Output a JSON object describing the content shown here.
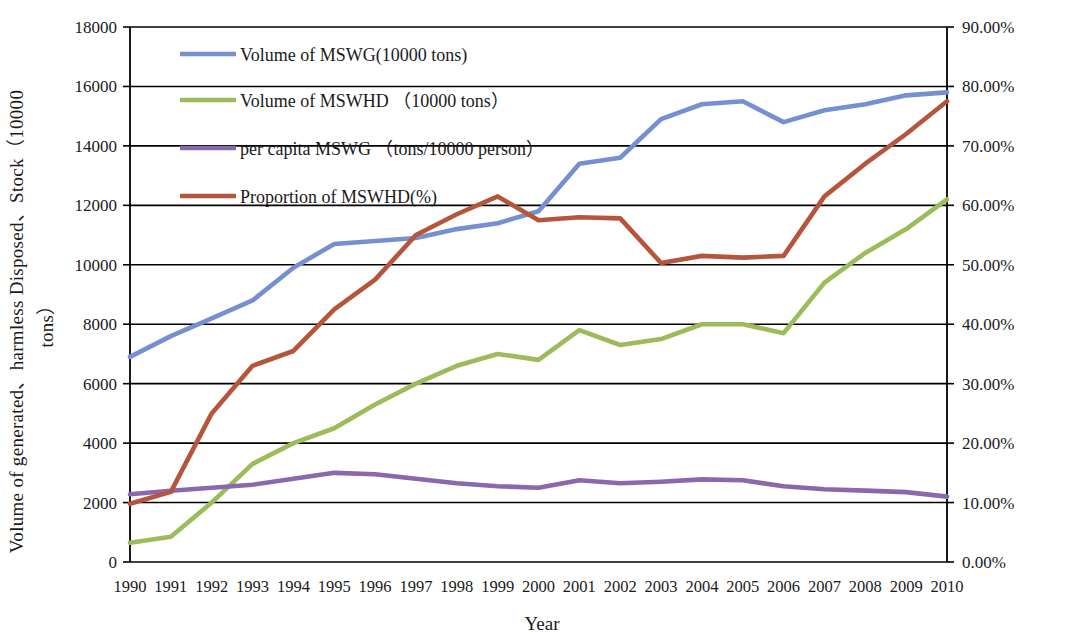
{
  "chart_data": {
    "type": "line",
    "title": "",
    "xlabel": "Year",
    "ylabel": "Volume of generated、harmless Disposed、Stock（10000 tons）",
    "ylabel_line1": "Volume of generated、harmless Disposed、Stock（10000",
    "ylabel_line2": "tons）",
    "y2label": "Proportion of MSWHD(%)",
    "grid": true,
    "legend_position": "top-left inside plot",
    "categories": [
      "1990",
      "1991",
      "1992",
      "1993",
      "1994",
      "1995",
      "1996",
      "1997",
      "1998",
      "1999",
      "2000",
      "2001",
      "2002",
      "2003",
      "2004",
      "2005",
      "2006",
      "2007",
      "2008",
      "2009",
      "2010"
    ],
    "ylim": [
      0,
      18000
    ],
    "yticks": [
      "0",
      "2000",
      "4000",
      "6000",
      "8000",
      "10000",
      "12000",
      "14000",
      "16000",
      "18000"
    ],
    "y2lim": [
      0,
      90
    ],
    "y2ticks": [
      "0.00%",
      "10.00%",
      "20.00%",
      "30.00%",
      "40.00%",
      "50.00%",
      "60.00%",
      "70.00%",
      "80.00%",
      "90.00%"
    ],
    "series": [
      {
        "name": "Volume of MSWG(10000 tons)",
        "color": "#7490d0",
        "axis": "left",
        "values": [
          6900,
          7600,
          8200,
          8800,
          9900,
          10700,
          10800,
          10900,
          11200,
          11400,
          11800,
          13400,
          13600,
          14900,
          15400,
          15500,
          14800,
          15200,
          15400,
          15700,
          15800
        ]
      },
      {
        "name": "Volume of MSWHD （10000 tons）",
        "color": "#9cbb5a",
        "axis": "left",
        "values": [
          650,
          850,
          2000,
          3300,
          4000,
          4500,
          5300,
          6000,
          6600,
          7000,
          6800,
          7800,
          7300,
          7500,
          8000,
          8000,
          7700,
          9400,
          10400,
          11200,
          12200
        ]
      },
      {
        "name": "per capita  MSWG （tons/10000 person）",
        "color": "#8a68ae",
        "axis": "left",
        "values": [
          2280,
          2400,
          2500,
          2600,
          2800,
          3000,
          2950,
          2800,
          2650,
          2550,
          2500,
          2750,
          2650,
          2700,
          2780,
          2750,
          2550,
          2450,
          2400,
          2350,
          2200
        ]
      },
      {
        "name": "Proportion of MSWHD(%)",
        "color": "#b4553c",
        "axis": "right",
        "values": [
          9.8,
          11.8,
          25.0,
          33.0,
          35.5,
          42.5,
          47.5,
          55.0,
          58.5,
          61.5,
          57.5,
          58.0,
          57.8,
          50.3,
          51.5,
          51.2,
          51.5,
          61.5,
          67.0,
          72.0,
          77.5
        ]
      }
    ]
  },
  "legend": {
    "items": [
      {
        "label": "Volume of MSWG(10000 tons)",
        "color": "#7490d0"
      },
      {
        "label": "Volume of MSWHD （10000 tons）",
        "color": "#9cbb5a"
      },
      {
        "label": "per capita  MSWG （tons/10000 person）",
        "color": "#8a68ae"
      },
      {
        "label": "Proportion of MSWHD(%)",
        "color": "#b4553c"
      }
    ]
  }
}
